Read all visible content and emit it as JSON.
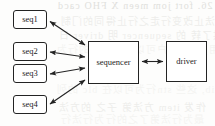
{
  "diagram": {
    "type": "block-diagram",
    "style": {
      "stroke": "#232323",
      "fill": "#ffffff",
      "text": "#1d1d1d",
      "background": "#fdfdfc",
      "ghost_text": "#c9c9c4"
    },
    "nodes": [
      {
        "id": "seq1",
        "label": "seq1",
        "shape": "rounded-rect",
        "x": 13,
        "y": 10,
        "w": 34,
        "h": 19
      },
      {
        "id": "seq2",
        "label": "seq2",
        "shape": "rounded-rect",
        "x": 13,
        "y": 42,
        "w": 34,
        "h": 19
      },
      {
        "id": "seq3",
        "label": "seq3",
        "shape": "rounded-rect",
        "x": 13,
        "y": 64,
        "w": 34,
        "h": 19
      },
      {
        "id": "seq4",
        "label": "seq4",
        "shape": "rounded-rect",
        "x": 13,
        "y": 95,
        "w": 34,
        "h": 19
      },
      {
        "id": "sequencer",
        "label": "sequencer",
        "shape": "rect",
        "x": 88,
        "y": 41,
        "w": 51,
        "h": 43
      },
      {
        "id": "driver",
        "label": "driver",
        "shape": "rect",
        "x": 166,
        "y": 41,
        "w": 41,
        "h": 41
      }
    ],
    "edges": [
      {
        "id": "edge-seq1-sequencer",
        "from": "seq1",
        "to": "sequencer",
        "arrow": "both"
      },
      {
        "id": "edge-seq2-sequencer",
        "from": "seq2",
        "to": "sequencer",
        "arrow": "both"
      },
      {
        "id": "edge-seq3-sequencer",
        "from": "seq3",
        "to": "sequencer",
        "arrow": "both"
      },
      {
        "id": "edge-seq4-sequencer",
        "from": "seq4",
        "to": "sequencer",
        "arrow": "both"
      },
      {
        "id": "edge-sequencer-driver",
        "from": "sequencer",
        "to": "driver",
        "arrow": "both"
      }
    ]
  },
  "background_showthrough": {
    "description": "faint mirrored bleed-through text from the reverse side of the scanned page",
    "lines": [
      {
        "text": "on any 26. fort jom meen X FHO cacd",
        "x": 57,
        "y": 2
      },
      {
        "text": "果用户提法止改变行走之行止得同的门制",
        "x": 60,
        "y": 14
      },
      {
        "text": "行国 提供了转 的 sequencer 明 driver 日",
        "x": 58,
        "y": 28
      },
      {
        "text": "用, 以便用户可以在不体的的行为",
        "x": 56,
        "y": 42
      },
      {
        "text": "seqlib, 这些 stn行为可以在 blc 的列",
        "x": 56,
        "y": 82
      },
      {
        "text": "作发 item 方法第 子之 的方法",
        "x": 58,
        "y": 100
      },
      {
        "text": "最为行法第了之的行为行法行",
        "x": 60,
        "y": 112
      }
    ]
  }
}
